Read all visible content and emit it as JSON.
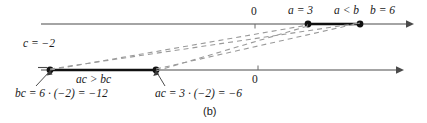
{
  "figure": {
    "caption": "(b)",
    "colors": {
      "axis": "#4a4a4a",
      "segment": "#111111",
      "dashed": "#8a8a8a",
      "dot": "#111111",
      "text": "#1a1a1a",
      "background": "#ffffff"
    }
  },
  "top_axis": {
    "name": "upper-number-line",
    "origin_label": "0",
    "points": [
      {
        "label": "a = 3",
        "value": 3
      },
      {
        "label": "b = 6",
        "value": 6
      }
    ],
    "relation_label": "a < b",
    "segment": {
      "from": 3,
      "to": 6
    }
  },
  "bottom_axis": {
    "name": "lower-number-line",
    "origin_label": "0",
    "points": [
      {
        "label": "bc = 6 · (−2) = −12",
        "value": -12
      },
      {
        "label": "ac = 3 · (−2) = −6",
        "value": -6
      }
    ],
    "relation_label": "ac > bc",
    "segment": {
      "from": -12,
      "to": -6
    }
  },
  "multiplier": {
    "label": "c = −2",
    "value": -2
  }
}
